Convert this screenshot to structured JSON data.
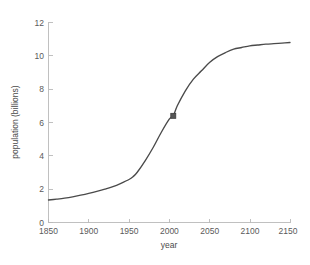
{
  "figure": {
    "background_color": "#ffffff",
    "axes_color": "#b9b9b9",
    "line_color": "#4a4a4a",
    "marker_color": "#565656",
    "text_color": "#5a5a5a"
  },
  "axes": {
    "x_title": "year",
    "y_title": "population (billions)",
    "x_ticks": [
      "1850",
      "1900",
      "1950",
      "2000",
      "2050",
      "2100",
      "2150"
    ],
    "y_ticks": [
      "0",
      "2",
      "4",
      "6",
      "8",
      "10",
      "12"
    ]
  },
  "chart_data": {
    "type": "line",
    "title": "",
    "subtitle": "",
    "xlabel": "year",
    "ylabel": "population (billions)",
    "xlim": [
      1850,
      2150
    ],
    "ylim": [
      0,
      12
    ],
    "xticks": [
      1850,
      1900,
      1950,
      2000,
      2050,
      2100,
      2150
    ],
    "yticks": [
      0,
      2,
      4,
      6,
      8,
      10,
      12
    ],
    "grid": false,
    "legend": null,
    "legend_position": "none",
    "series": [
      {
        "name": "population",
        "style": "solid-line",
        "color": "#4a4a4a",
        "x": [
          1850,
          1860,
          1870,
          1880,
          1890,
          1900,
          1910,
          1920,
          1930,
          1940,
          1950,
          1955,
          1960,
          1970,
          1980,
          1990,
          2000,
          2005,
          2010,
          2020,
          2030,
          2040,
          2050,
          2060,
          2070,
          2080,
          2090,
          2100,
          2110,
          2120,
          2130,
          2140,
          2150
        ],
        "y": [
          1.35,
          1.4,
          1.46,
          1.54,
          1.64,
          1.75,
          1.87,
          2.0,
          2.15,
          2.35,
          2.58,
          2.75,
          3.0,
          3.7,
          4.5,
          5.4,
          6.2,
          6.4,
          7.0,
          7.9,
          8.6,
          9.1,
          9.6,
          9.95,
          10.2,
          10.4,
          10.5,
          10.6,
          10.65,
          10.7,
          10.73,
          10.76,
          10.8
        ]
      }
    ],
    "markers": [
      {
        "name": "current-population-marker",
        "shape": "square",
        "x": 2005,
        "y": 6.4,
        "color": "#565656"
      }
    ],
    "annotations": []
  }
}
